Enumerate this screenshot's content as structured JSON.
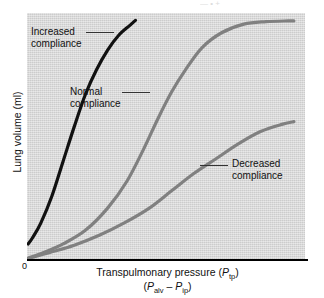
{
  "figure": {
    "background_color": "#ffffff",
    "plot_background_color": "#d5d5d5",
    "axis_color": "#000000",
    "origin_label": "0",
    "top_crop_fragment": "— • +"
  },
  "axes": {
    "y_title": "Lung volume (ml)",
    "x_title_main_prefix": "Transpulmonary pressure (",
    "x_title_symbol": "P",
    "x_title_symbol_sub": "tp",
    "x_title_main_suffix": ")",
    "x_title_second_open": "(",
    "x_title_second_sym1": "P",
    "x_title_second_sub1": "alv",
    "x_title_second_minus": " – ",
    "x_title_second_sym2": "P",
    "x_title_second_sub2": "ip",
    "x_title_second_close": ")"
  },
  "annotations": [
    {
      "line1": "Increased",
      "line2": "compliance"
    },
    {
      "line1": "Normal",
      "line2": "compliance"
    },
    {
      "line1": "Decreased",
      "line2": "compliance"
    }
  ],
  "chart_data": {
    "type": "line",
    "title": "",
    "xlabel": "Transpulmonary pressure (Ptp) (Palv – Pip)",
    "ylabel": "Lung volume (ml)",
    "xlim": [
      0,
      100
    ],
    "ylim": [
      0,
      100
    ],
    "grid": false,
    "legend_position": "inline-annotations",
    "x_tick_labels": [
      "0"
    ],
    "y_tick_labels": [],
    "series": [
      {
        "name": "Increased compliance",
        "color": "#111111",
        "width": 3.2,
        "x": [
          0.4,
          2,
          5,
          9,
          13,
          17,
          21,
          25,
          29,
          33,
          37,
          39
        ],
        "y": [
          6.5,
          9,
          15,
          26,
          40,
          54,
          67,
          77,
          85,
          91,
          95,
          97
        ]
      },
      {
        "name": "Normal compliance",
        "color": "#808080",
        "width": 3.2,
        "x": [
          0.5,
          6,
          13,
          21,
          29,
          36,
          42,
          47,
          52,
          57,
          63,
          70,
          78,
          86,
          94,
          96
        ],
        "y": [
          0.8,
          3,
          6.5,
          12,
          21,
          32,
          45,
          57,
          68,
          77,
          86,
          92,
          95.5,
          96.5,
          96.8,
          96.8
        ]
      },
      {
        "name": "Decreased compliance",
        "color": "#808080",
        "width": 3.2,
        "x": [
          0.5,
          8,
          17,
          26,
          35,
          44,
          52,
          60,
          68,
          76,
          84,
          92,
          96
        ],
        "y": [
          0.6,
          3,
          6,
          10,
          15,
          21,
          28,
          35,
          41,
          47,
          52,
          55,
          56
        ]
      }
    ]
  }
}
